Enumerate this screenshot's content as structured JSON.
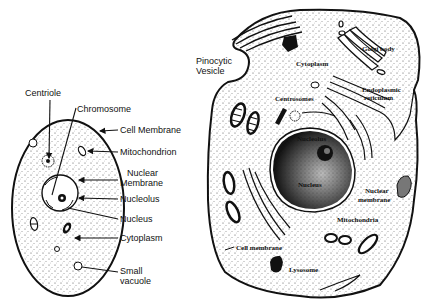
{
  "plant_cell_simple": {
    "labels": {
      "centriole": "Centriole",
      "chromosome": "Chromosome",
      "cell_membrane": "Cell Membrane",
      "mitochondrion": "Mitochondrion",
      "nuclear_membrane_1": "Nuclear",
      "nuclear_membrane_2": "Membrane",
      "nucleolus": "Nucleolus",
      "nucleus": "Nucleus",
      "cytoplasm": "Cytoplasm",
      "small_vacuole_1": "Small",
      "small_vacuole_2": "vacuole"
    }
  },
  "animal_cell_detailed": {
    "labels": {
      "pinocytic_1": "Pinocytic",
      "pinocytic_2": "Vesicle",
      "cytoplasm": "Cytoplasm",
      "golgi_body": "Golgi body",
      "er_1": "Endoplasmic",
      "er_2": "reticulum",
      "centrosomes": "Centrosomes",
      "nucleolus": "Nucleolus",
      "nucleus": "Nucleus",
      "nuclear_membrane_1": "Nuclear",
      "nuclear_membrane_2": "membrane",
      "mitochondria": "Mitochondria",
      "cell_membrane": "Cell membrane",
      "lysosome": "Lysosome"
    }
  }
}
